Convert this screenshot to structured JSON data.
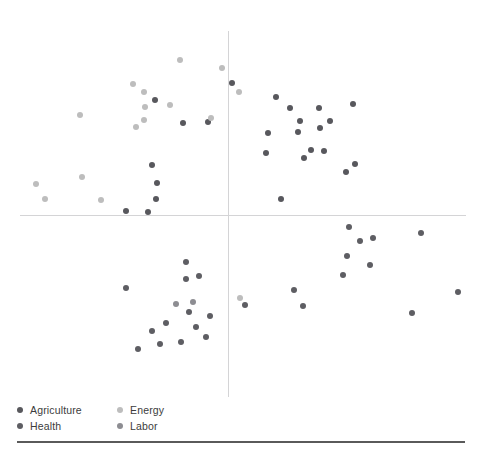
{
  "chart_data": {
    "type": "scatter",
    "title": "",
    "xlabel": "",
    "ylabel": "",
    "grid": false,
    "legend_position": "bottom-left",
    "axis_origin_px": {
      "x": 228,
      "y": 215
    },
    "axis_extent_px": {
      "x_min": 20,
      "x_max": 466,
      "y_min": 31,
      "y_max": 397
    },
    "xlim": [
      -100,
      100
    ],
    "ylim": [
      -100,
      100
    ],
    "colors": {
      "Agriculture": "#58585d",
      "Energy": "#bdbdbd",
      "Health": "#5e5e63",
      "Labor": "#8d8d92"
    },
    "series": [
      {
        "name": "Agriculture",
        "color": "#58585d",
        "points_px": [
          [
            183,
            123
          ],
          [
            208,
            122
          ],
          [
            155,
            100
          ],
          [
            152,
            165
          ],
          [
            157,
            183
          ],
          [
            156,
            199
          ],
          [
            126,
            211
          ],
          [
            148,
            212
          ],
          [
            232,
            83
          ],
          [
            276,
            97
          ],
          [
            290,
            108
          ],
          [
            300,
            121
          ],
          [
            319,
            108
          ],
          [
            353,
            104
          ],
          [
            268,
            133
          ],
          [
            298,
            132
          ],
          [
            320,
            128
          ],
          [
            330,
            121
          ],
          [
            324,
            151
          ],
          [
            311,
            150
          ],
          [
            355,
            164
          ],
          [
            346,
            172
          ],
          [
            281,
            199
          ],
          [
            304,
            158
          ],
          [
            266,
            153
          ]
        ]
      },
      {
        "name": "Energy",
        "color": "#bdbdbd",
        "points_px": [
          [
            180,
            60
          ],
          [
            222,
            68
          ],
          [
            239,
            92
          ],
          [
            133,
            84
          ],
          [
            144,
            92
          ],
          [
            145,
            107
          ],
          [
            144,
            120
          ],
          [
            136,
            127
          ],
          [
            80,
            115
          ],
          [
            170,
            105
          ],
          [
            211,
            118
          ],
          [
            82,
            177
          ],
          [
            36,
            184
          ],
          [
            45,
            199
          ],
          [
            101,
            200
          ],
          [
            240,
            298
          ]
        ]
      },
      {
        "name": "Health",
        "color": "#5e5e63",
        "points_px": [
          [
            186,
            262
          ],
          [
            199,
            276
          ],
          [
            186,
            279
          ],
          [
            126,
            288
          ],
          [
            245,
            305
          ],
          [
            294,
            290
          ],
          [
            303,
            306
          ],
          [
            349,
            227
          ],
          [
            360,
            241
          ],
          [
            373,
            238
          ],
          [
            347,
            256
          ],
          [
            370,
            265
          ],
          [
            343,
            275
          ],
          [
            421,
            233
          ],
          [
            458,
            292
          ],
          [
            412,
            313
          ],
          [
            189,
            312
          ],
          [
            166,
            323
          ],
          [
            152,
            331
          ],
          [
            160,
            344
          ],
          [
            138,
            349
          ],
          [
            181,
            342
          ],
          [
            210,
            316
          ],
          [
            196,
            327
          ],
          [
            206,
            337
          ]
        ]
      },
      {
        "name": "Labor",
        "color": "#8d8d92",
        "points_px": [
          [
            193,
            302
          ],
          [
            176,
            304
          ]
        ]
      }
    ]
  },
  "legend": {
    "rows": [
      [
        {
          "label": "Agriculture",
          "series": "Agriculture"
        },
        {
          "label": "Energy",
          "series": "Energy"
        }
      ],
      [
        {
          "label": "Health",
          "series": "Health"
        },
        {
          "label": "Labor",
          "series": "Labor"
        }
      ]
    ]
  }
}
